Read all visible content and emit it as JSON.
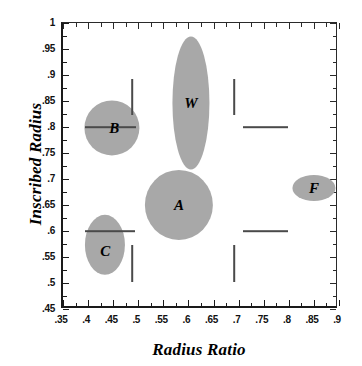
{
  "chart_data": {
    "type": "scatter",
    "title": "",
    "xlabel": "Radius Ratio",
    "ylabel": "Inscribed Radius",
    "xlim": [
      0.35,
      0.9
    ],
    "ylim": [
      0.45,
      1.0
    ],
    "grid": false,
    "legend": "none",
    "xticks": [
      ".35",
      ".4",
      ".45",
      ".5",
      ".55",
      ".6",
      ".65",
      ".7",
      ".75",
      ".8",
      ".85",
      ".9"
    ],
    "xtick_values": [
      0.35,
      0.4,
      0.45,
      0.5,
      0.55,
      0.6,
      0.65,
      0.7,
      0.75,
      0.8,
      0.85,
      0.9
    ],
    "yticks": [
      "1",
      ".95",
      ".9",
      ".85",
      ".8",
      ".75",
      ".7",
      ".65",
      ".6",
      ".55",
      ".5",
      ".45"
    ],
    "ytick_values": [
      1.0,
      0.95,
      0.9,
      0.85,
      0.8,
      0.75,
      0.7,
      0.65,
      0.6,
      0.55,
      0.5,
      0.45
    ],
    "regions": [
      {
        "label": "B",
        "x": 0.452,
        "y": 0.797,
        "x_width": 0.11,
        "y_height": 0.106,
        "color": "#a8a8a8",
        "label_dx": 0.004,
        "label_dy": 0.0
      },
      {
        "label": "W",
        "x": 0.609,
        "y": 0.845,
        "x_width": 0.074,
        "y_height": 0.256,
        "color": "#a8a8a8",
        "label_dx": 0.0,
        "label_dy": 0.0
      },
      {
        "label": "A",
        "x": 0.585,
        "y": 0.648,
        "x_width": 0.136,
        "y_height": 0.135,
        "color": "#a8a8a8",
        "label_dx": 0.0,
        "label_dy": 0.0
      },
      {
        "label": "C",
        "x": 0.438,
        "y": 0.571,
        "x_width": 0.08,
        "y_height": 0.116,
        "color": "#a8a8a8",
        "label_dx": 0.0,
        "label_dy": -0.012
      },
      {
        "label": "F",
        "x": 0.854,
        "y": 0.681,
        "x_width": 0.086,
        "y_height": 0.05,
        "color": "#a8a8a8",
        "label_dx": 0.0,
        "label_dy": 0.0
      }
    ],
    "range_bars_vertical": [
      {
        "x": 0.492,
        "y0": 0.822,
        "y1": 0.89
      },
      {
        "x": 0.492,
        "y0": 0.5,
        "y1": 0.572
      },
      {
        "x": 0.695,
        "y0": 0.822,
        "y1": 0.89
      },
      {
        "x": 0.695,
        "y0": 0.5,
        "y1": 0.572
      }
    ],
    "range_bars_horizontal": [
      {
        "y": 0.798,
        "x0": 0.397,
        "x1": 0.5
      },
      {
        "y": 0.798,
        "x0": 0.712,
        "x1": 0.802
      },
      {
        "y": 0.598,
        "x0": 0.398,
        "x1": 0.498
      },
      {
        "y": 0.598,
        "x0": 0.712,
        "x1": 0.802
      }
    ],
    "colors": {
      "blob": "#a8a8a8",
      "axis": "#1a1a1a",
      "bar": "#4a4a4a",
      "background": "#ffffff"
    }
  }
}
